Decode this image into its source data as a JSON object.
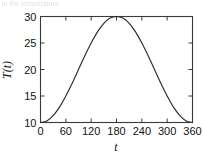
{
  "figure": {
    "caption_sliver": "in the temperature"
  },
  "chart_data": {
    "type": "line",
    "title": "",
    "subtitle": "",
    "xlabel": "t",
    "ylabel": "T(t)",
    "xlim": [
      0,
      360
    ],
    "ylim": [
      10,
      30
    ],
    "xticks": [
      0,
      60,
      120,
      180,
      240,
      300,
      360
    ],
    "xtick_labels": [
      "0",
      "60",
      "120",
      "180",
      "240",
      "300",
      "360"
    ],
    "yticks": [
      10,
      15,
      20,
      25,
      30
    ],
    "ytick_labels": [
      "10",
      "15",
      "20",
      "25",
      "30"
    ],
    "grid": false,
    "legend": null,
    "legend_position": "none",
    "tick_direction": "in",
    "frame": "box",
    "line_color": "#2b2b2b",
    "series": [
      {
        "name": "T(t)",
        "formula": "T(t) = 20 - 10*cos(2*pi*t/360)",
        "x": [
          0,
          15,
          30,
          45,
          60,
          75,
          90,
          105,
          120,
          135,
          150,
          165,
          180,
          195,
          210,
          225,
          240,
          255,
          270,
          285,
          300,
          315,
          330,
          345,
          360
        ],
        "y": [
          10.0,
          10.3,
          11.3,
          12.9,
          15.0,
          17.4,
          20.0,
          22.6,
          25.0,
          27.1,
          28.7,
          29.7,
          30.0,
          29.7,
          28.7,
          27.1,
          25.0,
          22.6,
          20.0,
          17.4,
          15.0,
          12.9,
          11.3,
          10.3,
          10.0
        ]
      }
    ],
    "annotations": [
      {
        "label": "minimum",
        "x": 0,
        "y": 10
      },
      {
        "label": "maximum",
        "x": 180,
        "y": 30
      },
      {
        "label": "minimum",
        "x": 360,
        "y": 10
      }
    ]
  }
}
